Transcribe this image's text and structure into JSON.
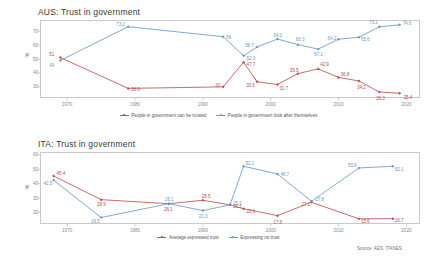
{
  "source_note": "Source: AES, ITANES",
  "ylabel": "%",
  "charts": [
    {
      "id": "aus",
      "title": "AUS: Trust in government",
      "type": "line",
      "xlabel": "",
      "ylabel": "%",
      "xlim": [
        1966,
        2022
      ],
      "ylim": [
        22,
        78
      ],
      "xticks": [
        "1970",
        "1980",
        "1990",
        "2000",
        "2010",
        "2020"
      ],
      "xtickvals": [
        1970,
        1980,
        1990,
        2000,
        2010,
        2020
      ],
      "yticks": [
        "30",
        "40",
        "50",
        "60",
        "70"
      ],
      "ytickvals": [
        30,
        40,
        50,
        60,
        70
      ],
      "grid": false,
      "legend_position": "bottom",
      "series": [
        {
          "name": "People in government can be trusted",
          "color": "#c0504d",
          "x": [
            1969,
            1979,
            1993,
            1996,
            1998,
            2001,
            2004,
            2007,
            2010,
            2013,
            2016,
            2019
          ],
          "values": [
            51,
            28.9,
            30,
            47.7,
            33.6,
            31.7,
            39.5,
            42.9,
            36.8,
            34.2,
            26.3,
            25.4
          ],
          "labels": [
            "51",
            "28.9",
            "30",
            "47.7",
            "33.6",
            "31.7",
            "39.5",
            "42.9",
            "36.8",
            "34.2",
            "26.3",
            "25.4"
          ]
        },
        {
          "name": "People in government look after themselves",
          "color": "#6b9bc3",
          "x": [
            1969,
            1979,
            1993,
            1996,
            1998,
            2001,
            2004,
            2007,
            2010,
            2013,
            2016,
            2019
          ],
          "values": [
            49,
            73.2,
            66,
            52.3,
            58.7,
            64.3,
            60.3,
            57.1,
            64.2,
            65.6,
            73.1,
            74.6
          ],
          "labels": [
            "49",
            "73.2",
            "66",
            "52.3",
            "58.7",
            "64.3",
            "60.3",
            "57.1",
            "64.2",
            "65.6",
            "73.1",
            "74.6"
          ]
        }
      ]
    },
    {
      "id": "ita",
      "title": "ITA: Trust in government",
      "type": "line",
      "xlabel": "",
      "ylabel": "%",
      "xlim": [
        1966,
        2022
      ],
      "ylim": [
        12,
        62
      ],
      "xticks": [
        "1970",
        "1980",
        "1990",
        "2000",
        "2010",
        "2020"
      ],
      "xtickvals": [
        1970,
        1980,
        1990,
        2000,
        2010,
        2020
      ],
      "yticks": [
        "20",
        "30",
        "40",
        "50",
        "60"
      ],
      "ytickvals": [
        20,
        30,
        40,
        50,
        60
      ],
      "grid": false,
      "legend_position": "bottom",
      "series": [
        {
          "name": "Average expressed trust",
          "color": "#c0504d",
          "x": [
            1968,
            1975,
            1985,
            1990,
            1994,
            1996,
            2001,
            2006,
            2013,
            2018
          ],
          "values": [
            45.4,
            28.9,
            26.1,
            28.5,
            25.3,
            22.6,
            17.8,
            27.1,
            15.6,
            15.7
          ],
          "labels": [
            "45.4",
            "28.9",
            "26.1",
            "28.5",
            "25.3",
            "22.6",
            "17.8",
            "27.1",
            "15.6",
            "15.7"
          ]
        },
        {
          "name": "Expressing no trust",
          "color": "#6b9bc3",
          "x": [
            1968,
            1975,
            1985,
            1990,
            1994,
            1996,
            2001,
            2006,
            2013,
            2018
          ],
          "values": [
            42.5,
            16.5,
            26.1,
            21.3,
            25.3,
            52.1,
            46.7,
            27.8,
            50.9,
            52.1
          ],
          "labels": [
            "42.5",
            "16.5",
            "26.1",
            "21.3",
            "25.3",
            "52.1",
            "46.7",
            "27.8",
            "50.9",
            "52.1"
          ]
        }
      ]
    }
  ]
}
